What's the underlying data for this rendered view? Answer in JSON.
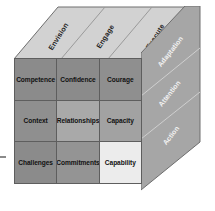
{
  "diagram": {
    "type": "3d-cube-matrix",
    "front_face": {
      "rows": [
        [
          {
            "label": "Competence",
            "color": "#8b8b8b"
          },
          {
            "label": "Confidence",
            "color": "#8b8b8b"
          },
          {
            "label": "Courage",
            "color": "#8f8f8f"
          }
        ],
        [
          {
            "label": "Context",
            "color": "#8f8f8f"
          },
          {
            "label": "Relationships",
            "color": "#a9a9a9"
          },
          {
            "label": "Capacity",
            "color": "#a2a2a2"
          }
        ],
        [
          {
            "label": "Challenges",
            "color": "#8b8b8b"
          },
          {
            "label": "Commitments",
            "color": "#949494"
          },
          {
            "label": "Capability",
            "color": "#ececec"
          }
        ]
      ]
    },
    "top_face": {
      "labels": [
        "Envision",
        "Engage",
        "Execute"
      ],
      "color": "#d2d2d2"
    },
    "right_face": {
      "labels": [
        "Adaptation",
        "Attention",
        "Action"
      ],
      "color": "#a6a6a6"
    },
    "colors": {
      "background": "#ffffff",
      "outline": "#5e5e5e",
      "top_panel": "#d2d2d2",
      "side_panel": "#a6a6a6",
      "side_text": "#f2f2f2",
      "front_text": "#111111"
    }
  }
}
